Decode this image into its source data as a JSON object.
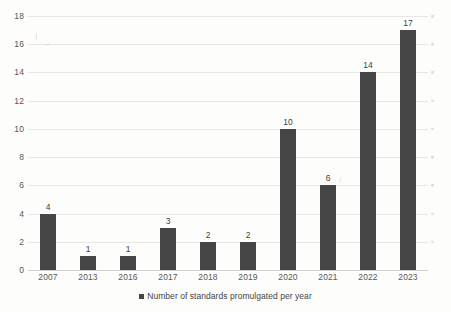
{
  "chart_data": {
    "type": "bar",
    "title": "",
    "subtitle": "",
    "xlabel": "",
    "ylabel": "",
    "categories": [
      "2007",
      "2013",
      "2016",
      "2017",
      "2018",
      "2019",
      "2020",
      "2021",
      "2022",
      "2023"
    ],
    "values": [
      4,
      1,
      1,
      3,
      2,
      2,
      10,
      6,
      14,
      17
    ],
    "series": [
      {
        "name": "Number of standards promulgated per year",
        "values": [
          4,
          1,
          1,
          3,
          2,
          2,
          10,
          6,
          14,
          17
        ],
        "color": "#464646"
      }
    ],
    "data_labels": [
      "4",
      "1",
      "1",
      "3",
      "2",
      "2",
      "10",
      "6",
      "14",
      "17"
    ],
    "ylim": [
      0,
      18
    ],
    "ytick_step": 2,
    "yticks": [
      0,
      2,
      4,
      6,
      8,
      10,
      12,
      14,
      16,
      18
    ],
    "ytick_labels": [
      "0",
      "2",
      "4",
      "6",
      "8",
      "10",
      "12",
      "14",
      "16",
      "18"
    ],
    "grid": true,
    "grid_axis": "y",
    "grid_color": "#e6e6e6",
    "legend": {
      "position": "bottom-center",
      "entries": [
        {
          "label": "Number of standards promulgated per year",
          "color": "#464646",
          "marker": "square"
        }
      ]
    },
    "background_color": "#fdfdfc",
    "bar_color": "#464646",
    "axis_label_color": "#585858"
  },
  "legend": {
    "label": "Number of standards promulgated per year"
  }
}
